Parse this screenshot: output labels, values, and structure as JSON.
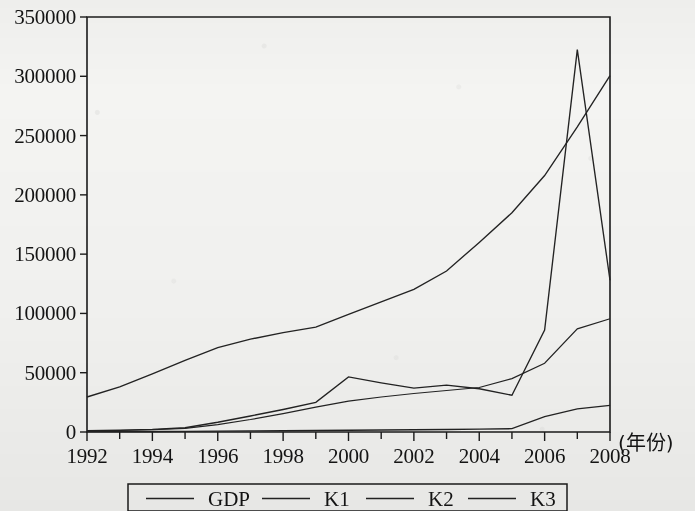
{
  "chart_data": {
    "type": "line",
    "title": "",
    "subtitle": "",
    "xlabel": "(年份)",
    "ylabel": "",
    "x": [
      1992,
      1993,
      1994,
      1995,
      1996,
      1997,
      1998,
      1999,
      2000,
      2001,
      2002,
      2003,
      2004,
      2005,
      2006,
      2007,
      2008
    ],
    "xtick_labels": [
      "1992",
      "1994",
      "1996",
      "1998",
      "2000",
      "2002",
      "2004",
      "2006",
      "2008"
    ],
    "xtick_values": [
      1992,
      1994,
      1996,
      1998,
      2000,
      2002,
      2004,
      2006,
      2008
    ],
    "ytick_labels": [
      "0",
      "50000",
      "100000",
      "150000",
      "200000",
      "250000",
      "300000",
      "350000"
    ],
    "ytick_values": [
      0,
      50000,
      100000,
      150000,
      200000,
      250000,
      300000,
      350000
    ],
    "xlim": [
      1992,
      2008
    ],
    "ylim": [
      0,
      350000
    ],
    "grid": false,
    "legend_position": "bottom-outside",
    "series": [
      {
        "name": "GDP",
        "values": [
          29500,
          38000,
          49000,
          60500,
          71200,
          78300,
          83800,
          88500,
          99200,
          109700,
          120300,
          135800,
          159900,
          184900,
          216300,
          257300,
          300600
        ]
      },
      {
        "name": "K1",
        "values": [
          1200,
          1600,
          2200,
          3600,
          8200,
          13500,
          19000,
          25000,
          46500,
          41500,
          37000,
          39500,
          36500,
          31000,
          86000,
          322500,
          128000
        ]
      },
      {
        "name": "K2",
        "values": [
          900,
          1300,
          1900,
          3000,
          6200,
          10500,
          15500,
          21000,
          26000,
          29500,
          32500,
          35000,
          37500,
          45000,
          58000,
          87000,
          95500
        ]
      },
      {
        "name": "K3",
        "values": [
          300,
          350,
          400,
          500,
          700,
          900,
          1100,
          1300,
          1500,
          1700,
          1900,
          2100,
          2400,
          2800,
          13000,
          19500,
          22500
        ]
      }
    ]
  },
  "legend": {
    "items": [
      {
        "label": "GDP"
      },
      {
        "label": "K1"
      },
      {
        "label": "K2"
      },
      {
        "label": "K3"
      }
    ]
  },
  "axes": {
    "x_caption": "(年份)"
  },
  "colors": {
    "line": "#232323",
    "axis": "#1b1b1b",
    "text": "#141414",
    "paper": "#f4f4f2"
  }
}
